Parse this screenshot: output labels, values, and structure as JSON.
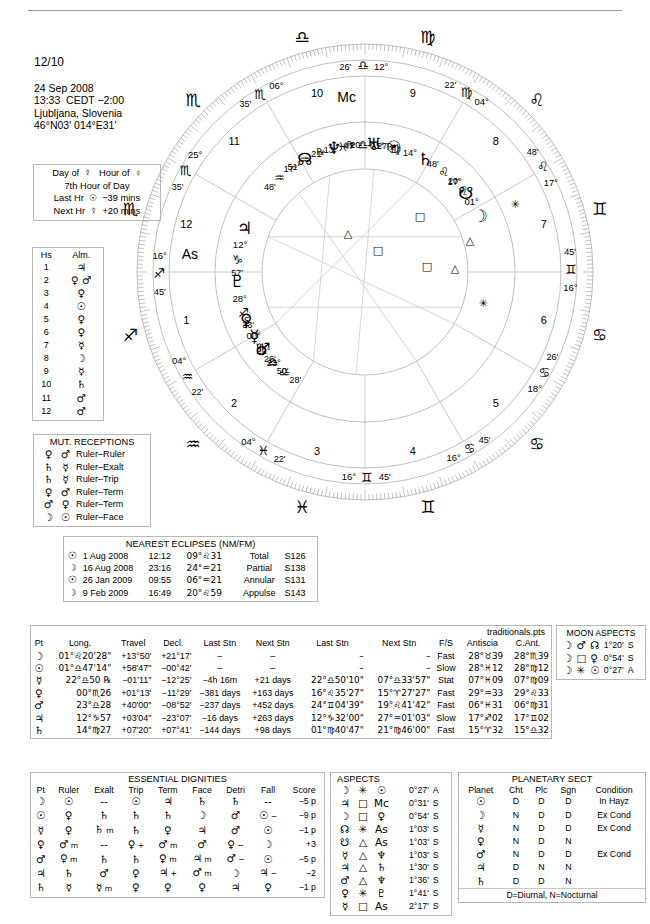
{
  "header": {
    "page_label": "12/10",
    "date": "24 Sep 2008",
    "time": "13:33  CEDT −2:00",
    "place": "Ljubljana, Slovenia",
    "coords": "46°N03' 014°E31'"
  },
  "planetary_hours": {
    "line1": "Day of  ☿   Hour of  ♀",
    "line2": "7th Hour of Day",
    "line3": "Last Hr  ☉  −39 mins",
    "line4": "Next Hr  ☿  +20 mins"
  },
  "almutens": {
    "col_house": "Hs",
    "col_almuten": "Alm.",
    "rows": [
      {
        "house": "1",
        "almuten": "♃"
      },
      {
        "house": "2",
        "almuten": "♀ ♂"
      },
      {
        "house": "3",
        "almuten": "♀"
      },
      {
        "house": "4",
        "almuten": "☉"
      },
      {
        "house": "5",
        "almuten": "♀"
      },
      {
        "house": "6",
        "almuten": "♀"
      },
      {
        "house": "7",
        "almuten": "☿"
      },
      {
        "house": "8",
        "almuten": "☽"
      },
      {
        "house": "9",
        "almuten": "☿"
      },
      {
        "house": "10",
        "almuten": "♄"
      },
      {
        "house": "11",
        "almuten": "♂"
      },
      {
        "house": "12",
        "almuten": "♂"
      }
    ]
  },
  "mutual_receptions": {
    "title": "MUT. RECEPTIONS",
    "rows": [
      {
        "a": "♀",
        "b": "♂",
        "kind": "Ruler–Ruler"
      },
      {
        "a": "♄",
        "b": "☿",
        "kind": "Ruler–Exalt"
      },
      {
        "a": "♄",
        "b": "☿",
        "kind": "Ruler–Trip"
      },
      {
        "a": "♀",
        "b": "♂",
        "kind": "Ruler–Term"
      },
      {
        "a": "♂",
        "b": "♀",
        "kind": "Ruler–Term"
      },
      {
        "a": "☽",
        "b": "☉",
        "kind": "Ruler–Face"
      }
    ]
  },
  "eclipses": {
    "title": "NEAREST ECLIPSES (NM/FM)",
    "rows": [
      {
        "body": "☉",
        "date": "1 Aug 2008",
        "time": "12:12",
        "pos": "09°♌31",
        "type": "Total",
        "saros": "S126"
      },
      {
        "body": "☽",
        "date": "16 Aug 2008",
        "time": "23:16",
        "pos": "24°♒21",
        "type": "Partial",
        "saros": "S138"
      },
      {
        "body": "☉",
        "date": "26 Jan 2009",
        "time": "09:55",
        "pos": "06°♒21",
        "type": "Annular",
        "saros": "S131"
      },
      {
        "body": "☽",
        "date": "9 Feb 2009",
        "time": "16:49",
        "pos": "20°♌59",
        "type": "Appulse",
        "saros": "S143"
      }
    ]
  },
  "points_table": {
    "file": "traditionals.pts",
    "columns": [
      "Pt",
      "Long.",
      "Travel",
      "Decl.",
      "Last Stn",
      "Next Stn",
      "Last Stn",
      "Next Stn",
      "F/S",
      "Antiscia",
      "C.Ant."
    ],
    "rows": [
      {
        "pt": "☽",
        "long": "01°♌20'28\"",
        "travel": "+13°50'",
        "decl": "+21°17'",
        "last_stn": "–",
        "next_stn": "–",
        "last_stn2": "–",
        "next_stn2": "–",
        "fs": "Fast",
        "antiscia": "28°♉39",
        "cant": "28°♏39"
      },
      {
        "pt": "☉",
        "long": "01°♎47'14\"",
        "travel": "+58'47\"",
        "decl": "−00°42'",
        "last_stn": "–",
        "next_stn": "–",
        "last_stn2": "–",
        "next_stn2": "–",
        "fs": "Slow",
        "antiscia": "28°♓12",
        "cant": "28°♍12"
      },
      {
        "pt": "☿",
        "long": "22°♎50 ℞",
        "travel": "−01'11\"",
        "decl": "−12°25'",
        "last_stn": "−4h 16m",
        "next_stn": "+21 days",
        "last_stn2": "22°♎50'10\"",
        "next_stn2": "07°♎33'57\"",
        "fs": "Stat",
        "antiscia": "07°♓09",
        "cant": "07°♍09"
      },
      {
        "pt": "♀",
        "long": "00°♏26",
        "travel": "+01°13'",
        "decl": "−11°29'",
        "last_stn": "−381 days",
        "next_stn": "+163 days",
        "last_stn2": "16°♌35'27\"",
        "next_stn2": "15°♈27'27\"",
        "fs": "Fast",
        "antiscia": "29°♒33",
        "cant": "29°♌33"
      },
      {
        "pt": "♂",
        "long": "23°♎28",
        "travel": "+40'00\"",
        "decl": "−08°52'",
        "last_stn": "−237 days",
        "next_stn": "+452 days",
        "last_stn2": "24°♊04'39\"",
        "next_stn2": "19°♌41'42\"",
        "fs": "Fast",
        "antiscia": "06°♓31",
        "cant": "06°♍31"
      },
      {
        "pt": "♃",
        "long": "12°♑57",
        "travel": "+03'04\"",
        "decl": "−23°07'",
        "last_stn": "−16 days",
        "next_stn": "+263 days",
        "last_stn2": "12°♑32'00\"",
        "next_stn2": "27°♒01'03\"",
        "fs": "Slow",
        "antiscia": "17°♐02",
        "cant": "17°♊02"
      },
      {
        "pt": "♄",
        "long": "14°♍27",
        "travel": "+07'20\"",
        "decl": "+07°41'",
        "last_stn": "−144 days",
        "next_stn": "+98 days",
        "last_stn2": "01°♍40'47\"",
        "next_stn2": "21°♍46'00\"",
        "fs": "Fast",
        "antiscia": "15°♈32",
        "cant": "15°♎32"
      }
    ]
  },
  "moon_aspects": {
    "title": "MOON ASPECTS",
    "rows": [
      {
        "from": "☽",
        "aspect": "♂",
        "to": "☊",
        "orb": "1°20'",
        "sa": "S"
      },
      {
        "from": "☽",
        "aspect": "□",
        "to": "♀",
        "orb": "0°54'",
        "sa": "S"
      },
      {
        "from": "☽",
        "aspect": "✳",
        "to": "☉",
        "orb": "0°27'",
        "sa": "A"
      }
    ]
  },
  "essential_dignities": {
    "title": "ESSENTIAL DIGNITIES",
    "columns": [
      "Pt",
      "Ruler",
      "Exalt",
      "Trip",
      "Term",
      "Face",
      "Detri",
      "Fall",
      "Score"
    ],
    "rows": [
      {
        "pt": "☽",
        "ruler": "☉",
        "ruler_m": "",
        "exalt": "--",
        "exalt_m": "",
        "trip": "☉",
        "trip_m": "",
        "term": "♃",
        "term_m": "",
        "face": "♄",
        "face_m": "",
        "detri": "♄",
        "detri_m": "",
        "fall": "--",
        "fall_m": "",
        "score": "−5 p"
      },
      {
        "pt": "☉",
        "ruler": "♀",
        "ruler_m": "",
        "exalt": "♄",
        "exalt_m": "",
        "trip": "♄",
        "trip_m": "",
        "term": "♄",
        "term_m": "",
        "face": "☽",
        "face_m": "",
        "detri": "♂",
        "detri_m": "",
        "fall": "☉",
        "fall_m": "−",
        "score": "−9 p"
      },
      {
        "pt": "☿",
        "ruler": "♀",
        "ruler_m": "",
        "exalt": "♄",
        "exalt_m": "m",
        "trip": "♄",
        "trip_m": "",
        "term": "♀",
        "term_m": "",
        "face": "♃",
        "face_m": "",
        "detri": "♂",
        "detri_m": "",
        "fall": "☉",
        "fall_m": "",
        "score": "−1 p"
      },
      {
        "pt": "♀",
        "ruler": "♂",
        "ruler_m": "m",
        "exalt": "--",
        "exalt_m": "",
        "trip": "♀",
        "trip_m": "+",
        "term": "♂",
        "term_m": "m",
        "face": "♂",
        "face_m": "",
        "detri": "♀",
        "detri_m": "−",
        "fall": "☽",
        "fall_m": "",
        "score": "+3"
      },
      {
        "pt": "♂",
        "ruler": "♀",
        "ruler_m": "m",
        "exalt": "♄",
        "exalt_m": "",
        "trip": "♄",
        "trip_m": "",
        "term": "♀",
        "term_m": "m",
        "face": "♃",
        "face_m": "m",
        "detri": "♂",
        "detri_m": "−",
        "fall": "☉",
        "fall_m": "",
        "score": "−5 p"
      },
      {
        "pt": "♃",
        "ruler": "♄",
        "ruler_m": "",
        "exalt": "♂",
        "exalt_m": "",
        "trip": "♀",
        "trip_m": "",
        "term": "♃",
        "term_m": "+",
        "face": "♂",
        "face_m": "m",
        "detri": "☽",
        "detri_m": "",
        "fall": "♃",
        "fall_m": "−",
        "score": "−2"
      },
      {
        "pt": "♄",
        "ruler": "☿",
        "ruler_m": "",
        "exalt": "☿",
        "exalt_m": "m",
        "trip": "♀",
        "trip_m": "",
        "term": "♀",
        "term_m": "",
        "face": "♀",
        "face_m": "",
        "detri": "♃",
        "detri_m": "",
        "fall": "♀",
        "fall_m": "",
        "score": "−1 p"
      }
    ]
  },
  "aspects": {
    "title": "ASPECTS",
    "rows": [
      {
        "from": "☽",
        "aspect": "✳",
        "to": "☉",
        "orb": "0°27'",
        "sa": "A"
      },
      {
        "from": "♃",
        "aspect": "□",
        "to": "Mc",
        "orb": "0°31'",
        "sa": "S"
      },
      {
        "from": "☽",
        "aspect": "□",
        "to": "♀",
        "orb": "0°54'",
        "sa": "S"
      },
      {
        "from": "☊",
        "aspect": "✳",
        "to": "As",
        "orb": "1°03'",
        "sa": "S"
      },
      {
        "from": "☋",
        "aspect": "△",
        "to": "As",
        "orb": "1°03'",
        "sa": "S"
      },
      {
        "from": "☿",
        "aspect": "△",
        "to": "♆",
        "orb": "1°03'",
        "sa": "S"
      },
      {
        "from": "♃",
        "aspect": "△",
        "to": "♄",
        "orb": "1°30'",
        "sa": "S"
      },
      {
        "from": "♂",
        "aspect": "△",
        "to": "♆",
        "orb": "1°36'",
        "sa": "S"
      },
      {
        "from": "♀",
        "aspect": "✳",
        "to": "♇",
        "orb": "1°41'",
        "sa": "S"
      },
      {
        "from": "☿",
        "aspect": "□",
        "to": "As",
        "orb": "2°17'",
        "sa": "S"
      }
    ]
  },
  "planetary_sect": {
    "title": "PLANETARY SECT",
    "columns": [
      "Planet",
      "Cht",
      "Plc",
      "Sgn",
      "Condition"
    ],
    "footer": "D=Diurnal, N=Nocturnal",
    "rows": [
      {
        "planet": "☉",
        "cht": "D",
        "plc": "D",
        "sgn": "D",
        "condition": "In Hayz"
      },
      {
        "planet": "☽",
        "cht": "N",
        "plc": "D",
        "sgn": "D",
        "condition": "Ex Cond"
      },
      {
        "planet": "☿",
        "cht": "N",
        "plc": "D",
        "sgn": "D",
        "condition": "Ex Cond"
      },
      {
        "planet": "♀",
        "cht": "N",
        "plc": "D",
        "sgn": "N",
        "condition": ""
      },
      {
        "planet": "♂",
        "cht": "N",
        "plc": "D",
        "sgn": "D",
        "condition": "Ex Cond"
      },
      {
        "planet": "♃",
        "cht": "D",
        "plc": "N",
        "sgn": "N",
        "condition": ""
      },
      {
        "planet": "♄",
        "cht": "D",
        "plc": "D",
        "sgn": "N",
        "condition": ""
      }
    ]
  },
  "wheel": {
    "cusps": [
      {
        "house": "1",
        "deg": "16°",
        "min": "45'",
        "sign": "♐",
        "label": "As"
      },
      {
        "house": "2",
        "deg": "04°",
        "min": "22'",
        "sign": "♒"
      },
      {
        "house": "3",
        "deg": "04°",
        "min": "22'",
        "sign": "♓"
      },
      {
        "house": "4",
        "deg": "16°",
        "min": "45'",
        "sign": "♊"
      },
      {
        "house": "5",
        "deg": "16°",
        "min": "45'",
        "sign": "♋"
      },
      {
        "house": "6",
        "deg": "18°",
        "min": "26'",
        "sign": "♋"
      },
      {
        "house": "7",
        "deg": "16°",
        "min": "45'",
        "sign": "♊"
      },
      {
        "house": "8",
        "deg": "17°",
        "min": "48'",
        "sign": "♌"
      },
      {
        "house": "9",
        "deg": "04°",
        "min": "22'",
        "sign": "♍"
      },
      {
        "house": "10",
        "deg": "12°",
        "min": "26'",
        "sign": "♎",
        "label": "Mc"
      },
      {
        "house": "11",
        "deg": "06°",
        "min": "35'",
        "sign": "♏"
      },
      {
        "house": "12",
        "deg": "25°",
        "min": "35'",
        "sign": "♏"
      }
    ],
    "planets": [
      {
        "name": "sun",
        "glyph": "☉",
        "deg": "01°",
        "sign": "♎",
        "min": "47'"
      },
      {
        "name": "saturn",
        "glyph": "♄",
        "deg": "14°",
        "sign": "♍",
        "min": "27'"
      },
      {
        "name": "south-node",
        "glyph": "☋",
        "deg": "17°",
        "sign": "♌",
        "min": "48'"
      },
      {
        "name": "moon",
        "glyph": "☽",
        "deg": "01°",
        "sign": "♌",
        "min": "20'"
      },
      {
        "name": "mercury",
        "glyph": "☿",
        "deg": "22°",
        "sign": "♎",
        "min": "50'",
        "retro": "S"
      },
      {
        "name": "mars",
        "glyph": "♂",
        "deg": "23°",
        "sign": "♎",
        "min": "28'"
      },
      {
        "name": "venus",
        "glyph": "♀",
        "deg": "00°",
        "sign": "♏",
        "min": "26'"
      },
      {
        "name": "pluto",
        "glyph": "♇",
        "deg": "28°",
        "sign": "♐",
        "min": "33'"
      },
      {
        "name": "jupiter",
        "glyph": "♃",
        "deg": "12°",
        "sign": "♑",
        "min": "57'"
      },
      {
        "name": "north-node",
        "glyph": "☊",
        "deg": "17°",
        "sign": "♒",
        "min": "48'",
        "retro": "℞"
      },
      {
        "name": "neptune",
        "glyph": "♆",
        "deg": "21°",
        "sign": "♒",
        "min": "51'",
        "retro": "℞"
      },
      {
        "name": "uranus",
        "glyph": "♅",
        "deg": "20°",
        "sign": "♓",
        "min": "13'",
        "retro": "℞"
      }
    ]
  }
}
